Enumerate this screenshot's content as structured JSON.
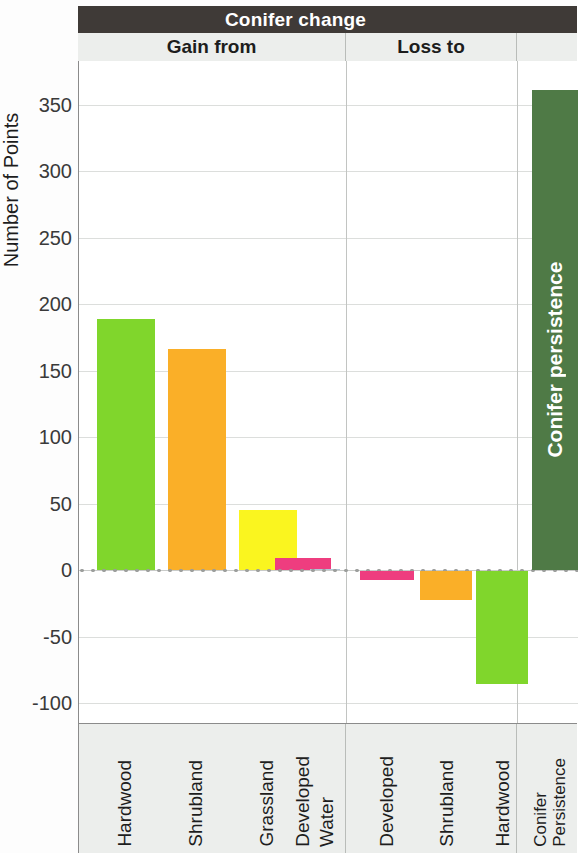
{
  "header": {
    "banner_title": "Conifer change",
    "sections": [
      {
        "id": "gain",
        "label": "Gain from"
      },
      {
        "id": "loss",
        "label": "Loss to"
      },
      {
        "id": "persistence",
        "label": ""
      }
    ]
  },
  "axis": {
    "ylabel": "Number of Points",
    "yticks": [
      "350",
      "300",
      "250",
      "200",
      "150",
      "100",
      "50",
      "0",
      "-50",
      "-100"
    ]
  },
  "bar_caption": "Conifer persistence",
  "xlabels": [
    {
      "line1": "Hardwood",
      "line2": ""
    },
    {
      "line1": "Shrubland",
      "line2": ""
    },
    {
      "line1": "Grassland",
      "line2": ""
    },
    {
      "line1": "Developed",
      "line2": ""
    },
    {
      "line1": "Water",
      "line2": ""
    },
    {
      "line1": "Developed",
      "line2": ""
    },
    {
      "line1": "Shrubland",
      "line2": ""
    },
    {
      "line1": "Hardwood",
      "line2": ""
    },
    {
      "line1": "Conifer",
      "line2": "Persistence"
    }
  ],
  "colors": {
    "hardwood": "#80D62C",
    "shrubland": "#FAAF28",
    "grassland": "#FAF51F",
    "developed": "#EE3D7F",
    "water": "#AFC6D8",
    "persistence": "#4F7A46",
    "banner_bg": "#3F3A37",
    "panel_bg": "#ECEEEC",
    "grid": "#DCDEDC",
    "axis": "#8B8B8B"
  },
  "chart_data": {
    "type": "bar",
    "title": "Conifer change",
    "xlabel": "",
    "ylabel": "Number of Points",
    "ylim": [
      -100,
      375
    ],
    "ytick_values": [
      350,
      300,
      250,
      200,
      150,
      100,
      50,
      0,
      -50,
      -100
    ],
    "grid": true,
    "legend": "none",
    "groups": [
      {
        "name": "Gain from",
        "categories": [
          "Hardwood",
          "Shrubland",
          "Grassland",
          "Developed",
          "Water"
        ],
        "values": [
          189,
          166,
          45,
          9,
          1
        ],
        "colors": [
          "#80D62C",
          "#FAAF28",
          "#FAF51F",
          "#EE3D7F",
          "#AFC6D8"
        ]
      },
      {
        "name": "Loss to",
        "categories": [
          "Developed",
          "Shrubland",
          "Hardwood"
        ],
        "values": [
          -7,
          -22,
          -85
        ],
        "colors": [
          "#EE3D7F",
          "#FAAF28",
          "#80D62C"
        ]
      },
      {
        "name": "Conifer persistence",
        "categories": [
          "Conifer Persistence"
        ],
        "values": [
          361
        ],
        "colors": [
          "#4F7A46"
        ]
      }
    ]
  }
}
